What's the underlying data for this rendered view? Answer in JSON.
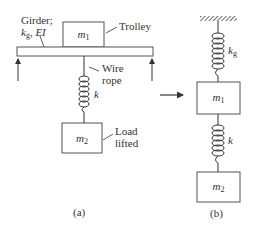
{
  "figure_a": {
    "girder_label_line1": "Girder;",
    "girder_label_k": "k",
    "girder_label_k_sub": "g",
    "girder_label_ei": ", EI",
    "trolley_label": "Trolley",
    "wire_label_line1": "Wire",
    "wire_label_line2": "rope",
    "spring_label": "k",
    "mass1": "m",
    "mass1_sub": "1",
    "mass2": "m",
    "mass2_sub": "2",
    "load_label_line1": "Load",
    "load_label_line2": "lifted",
    "caption": "(a)"
  },
  "figure_b": {
    "spring_top_label": "k",
    "spring_top_sub": "g",
    "mass1": "m",
    "mass1_sub": "1",
    "spring_bottom_label": "k",
    "mass2": "m",
    "mass2_sub": "2",
    "caption": "(b)"
  },
  "colors": {
    "stroke": "#333333",
    "box_stroke": "#555555"
  }
}
